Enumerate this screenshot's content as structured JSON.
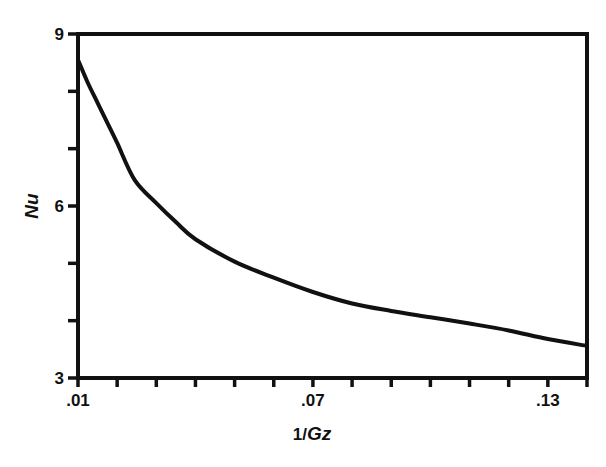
{
  "chart_data": {
    "type": "line",
    "title": "",
    "xlabel": "1/Gz",
    "xlabel_parts": {
      "prefix": "1/",
      "italic": "Gz"
    },
    "ylabel": "Nu",
    "xlim": [
      0.01,
      0.14
    ],
    "ylim": [
      3,
      9
    ],
    "x_tick_labels": [
      ".01",
      ".07",
      ".13"
    ],
    "x_tick_values": [
      0.01,
      0.07,
      0.13
    ],
    "x_minor_ticks": [
      0.02,
      0.03,
      0.04,
      0.05,
      0.06,
      0.08,
      0.09,
      0.1,
      0.11,
      0.12,
      0.14
    ],
    "y_tick_labels": [
      "3",
      "6",
      "9"
    ],
    "y_tick_values": [
      3,
      6,
      9
    ],
    "y_minor_ticks": [
      4,
      5,
      7,
      8
    ],
    "grid": false,
    "legend": null,
    "series": [
      {
        "name": "Nu",
        "x": [
          0.01,
          0.0125,
          0.015,
          0.0175,
          0.02,
          0.0245,
          0.03,
          0.035,
          0.04,
          0.05,
          0.06,
          0.07,
          0.08,
          0.09,
          0.1,
          0.11,
          0.12,
          0.13,
          0.14
        ],
        "values": [
          8.55,
          8.15,
          7.8,
          7.45,
          7.1,
          6.45,
          6.05,
          5.72,
          5.42,
          5.03,
          4.75,
          4.5,
          4.3,
          4.17,
          4.06,
          3.95,
          3.83,
          3.68,
          3.56
        ]
      }
    ],
    "colors": {
      "line": "#111111",
      "axis": "#111111",
      "background": "#ffffff"
    }
  }
}
